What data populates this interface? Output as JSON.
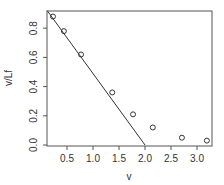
{
  "chart_data": {
    "type": "scatter",
    "title": "",
    "xlabel": "v",
    "ylabel": "v/Lf",
    "xlim": [
      0.12,
      3.3
    ],
    "ylim": [
      0.0,
      0.92
    ],
    "grid": false,
    "legend": null,
    "x_ticks": [
      "0.5",
      "1.0",
      "1.5",
      "2.0",
      "2.5",
      "3.0"
    ],
    "y_ticks": [
      "0.0",
      "0.2",
      "0.4",
      "0.6",
      "0.8"
    ],
    "series": [
      {
        "name": "observed",
        "marker": "open-circle",
        "x": [
          0.23,
          0.44,
          0.77,
          1.37,
          1.77,
          2.15,
          2.71,
          3.19
        ],
        "y": [
          0.88,
          0.78,
          0.62,
          0.36,
          0.21,
          0.12,
          0.05,
          0.03
        ]
      },
      {
        "name": "fitted line",
        "type": "line",
        "x": [
          0.12,
          2.0
        ],
        "y": [
          0.92,
          0.0
        ]
      }
    ]
  },
  "axes": {
    "xlabel": "v",
    "ylabel": "v/Lf",
    "x_ticks": [
      {
        "label": "0.5",
        "value": 0.5
      },
      {
        "label": "1.0",
        "value": 1.0
      },
      {
        "label": "1.5",
        "value": 1.5
      },
      {
        "label": "2.0",
        "value": 2.0
      },
      {
        "label": "2.5",
        "value": 2.5
      },
      {
        "label": "3.0",
        "value": 3.0
      }
    ],
    "y_ticks": [
      {
        "label": "0.0",
        "value": 0.0
      },
      {
        "label": "0.2",
        "value": 0.2
      },
      {
        "label": "0.4",
        "value": 0.4
      },
      {
        "label": "0.6",
        "value": 0.6
      },
      {
        "label": "0.8",
        "value": 0.8
      }
    ]
  }
}
